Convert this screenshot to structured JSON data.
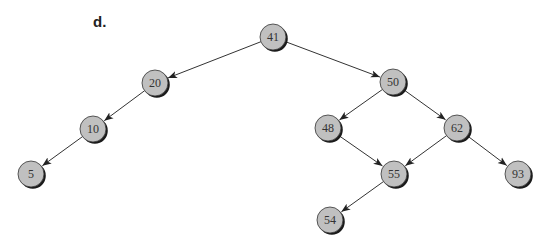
{
  "figure": {
    "label": "d.",
    "label_pos": {
      "x": 93,
      "y": 13
    },
    "node_radius": 13,
    "colors": {
      "node_fill": "#c0c0c0",
      "node_stroke": "#333333",
      "node_shadow": "#1a1a1a",
      "edge": "#333333",
      "text": "#333333"
    },
    "nodes": [
      {
        "id": "n41",
        "value": "41",
        "x": 273,
        "y": 37
      },
      {
        "id": "n20",
        "value": "20",
        "x": 155,
        "y": 83
      },
      {
        "id": "n50",
        "value": "50",
        "x": 393,
        "y": 82
      },
      {
        "id": "n10",
        "value": "10",
        "x": 93,
        "y": 129
      },
      {
        "id": "n48",
        "value": "48",
        "x": 328,
        "y": 128
      },
      {
        "id": "n62",
        "value": "62",
        "x": 457,
        "y": 128
      },
      {
        "id": "n5",
        "value": "5",
        "x": 31,
        "y": 174
      },
      {
        "id": "n55",
        "value": "55",
        "x": 394,
        "y": 174
      },
      {
        "id": "n93",
        "value": "93",
        "x": 518,
        "y": 174
      },
      {
        "id": "n54",
        "value": "54",
        "x": 330,
        "y": 220
      }
    ],
    "edges": [
      {
        "from": "n41",
        "to": "n20"
      },
      {
        "from": "n41",
        "to": "n50"
      },
      {
        "from": "n20",
        "to": "n10"
      },
      {
        "from": "n10",
        "to": "n5"
      },
      {
        "from": "n50",
        "to": "n48"
      },
      {
        "from": "n50",
        "to": "n62"
      },
      {
        "from": "n48",
        "to": "n55"
      },
      {
        "from": "n62",
        "to": "n55"
      },
      {
        "from": "n62",
        "to": "n93"
      },
      {
        "from": "n55",
        "to": "n54"
      }
    ]
  }
}
